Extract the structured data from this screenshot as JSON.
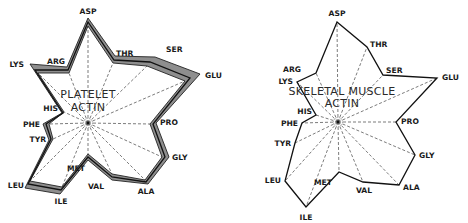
{
  "figure": {
    "amino_acid_order": [
      "ASP",
      "THR",
      "SER",
      "GLU",
      "PRO",
      "GLY",
      "ALA",
      "VAL",
      "MET",
      "ILE",
      "LEU",
      "TYR",
      "PHE",
      "HIS",
      "LYS",
      "ARG"
    ],
    "panels": [
      {
        "id": "platelet",
        "title_lines": [
          "PLATELET",
          "ACTIN"
        ],
        "shaded_range": true,
        "labels": [
          "ASP",
          "THR",
          "SER",
          "GLU",
          "PRO",
          "GLY",
          "ALA",
          "VAL",
          "MET",
          "ILE",
          "LEU",
          "TYR",
          "PHE",
          "HIS",
          "LYS",
          "ARG"
        ]
      },
      {
        "id": "skeletal",
        "title_lines": [
          "SKELETAL MUSCLE",
          "ACTIN"
        ],
        "shaded_range": false,
        "labels": [
          "ASP",
          "THR",
          "SER",
          "GLU",
          "PRO",
          "GLY",
          "ALA",
          "VAL",
          "MET",
          "ILE",
          "LEU",
          "TYR",
          "PHE",
          "HIS",
          "LYS",
          "ARG"
        ]
      }
    ]
  },
  "colors": {
    "line": "#111111",
    "band": "#8e8e8e",
    "spoke": "#444444"
  }
}
